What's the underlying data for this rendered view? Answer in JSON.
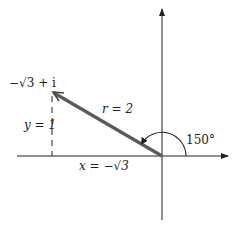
{
  "diagram": {
    "type": "complex-plane-polar-form",
    "point_label": "−√3 + i",
    "radius_label": "r = 2",
    "y_label": "y = 1",
    "x_label": "x = −√3",
    "angle_label": "150°",
    "colors": {
      "axis": "#222222",
      "vector": "#555555",
      "arc": "#222222",
      "dashed": "#222222",
      "text": "#222222"
    }
  }
}
